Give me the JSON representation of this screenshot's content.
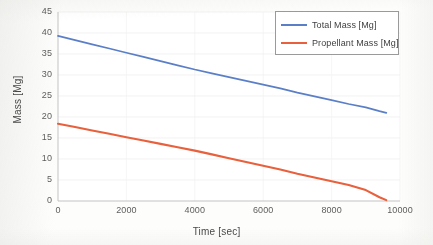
{
  "chart_data": {
    "type": "line",
    "title": "",
    "xlabel": "Time [sec]",
    "ylabel": "Mass [Mg]",
    "xlim": [
      0,
      10000
    ],
    "ylim": [
      0,
      45
    ],
    "xticks": [
      0,
      2000,
      4000,
      6000,
      8000,
      10000
    ],
    "yticks": [
      0,
      5,
      10,
      15,
      20,
      25,
      30,
      35,
      40,
      45
    ],
    "xtick_labels": [
      "0",
      "2000",
      "4000",
      "6000",
      "8000",
      "10000"
    ],
    "ytick_labels": [
      "0",
      "5",
      "10",
      "15",
      "20",
      "25",
      "30",
      "35",
      "40",
      "45"
    ],
    "grid": "horizontal-faint",
    "legend_position": "upper-right",
    "x": [
      0,
      500,
      1000,
      1500,
      2000,
      2500,
      3000,
      3500,
      4000,
      4500,
      5000,
      5500,
      6000,
      6500,
      7000,
      7500,
      8000,
      8500,
      9000,
      9400,
      9600
    ],
    "series": [
      {
        "name": "Total Mass [Mg]",
        "color": "#5B7FC7",
        "values": [
          39.3,
          38.3,
          37.3,
          36.3,
          35.3,
          34.3,
          33.3,
          32.3,
          31.3,
          30.4,
          29.5,
          28.6,
          27.7,
          26.8,
          25.8,
          24.9,
          24.0,
          23.1,
          22.3,
          21.4,
          21.0
        ]
      },
      {
        "name": "Propellant Mass [Mg]",
        "color": "#E8603C",
        "values": [
          18.4,
          17.6,
          16.8,
          16.0,
          15.2,
          14.4,
          13.6,
          12.8,
          12.0,
          11.1,
          10.2,
          9.3,
          8.4,
          7.5,
          6.5,
          5.6,
          4.7,
          3.8,
          2.6,
          0.9,
          0.2
        ]
      }
    ]
  },
  "axes": {
    "y_title": "Mass [Mg]",
    "x_title": "Time [sec]"
  },
  "legend": {
    "entries": [
      {
        "label": "Total Mass [Mg]",
        "color": "#5B7FC7"
      },
      {
        "label": "Propellant Mass [Mg]",
        "color": "#E8603C"
      }
    ]
  },
  "colors": {
    "total_mass": "#5B7FC7",
    "propellant_mass": "#E8603C",
    "axis": "#BFBFBF",
    "grid": "#EDEDED",
    "tick_text": "#5E5E5E"
  }
}
